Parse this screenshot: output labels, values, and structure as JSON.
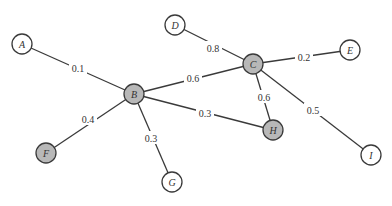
{
  "diagram": {
    "type": "weighted-graph",
    "width": 392,
    "height": 206,
    "colors": {
      "edge": "#3a3a3a",
      "node_stroke": "#3a3a3a",
      "node_fill_default": "#ffffff",
      "node_fill_highlight": "#b8b8b8",
      "text": "#333333"
    },
    "nodes": [
      {
        "id": "A",
        "label": "A",
        "x": 22,
        "y": 44,
        "r": 10,
        "highlighted": false
      },
      {
        "id": "B",
        "label": "B",
        "x": 134,
        "y": 94,
        "r": 10,
        "highlighted": true
      },
      {
        "id": "C",
        "label": "C",
        "x": 253,
        "y": 64,
        "r": 10,
        "highlighted": true
      },
      {
        "id": "D",
        "label": "D",
        "x": 175,
        "y": 25,
        "r": 10,
        "highlighted": false
      },
      {
        "id": "E",
        "label": "E",
        "x": 350,
        "y": 50,
        "r": 10,
        "highlighted": false
      },
      {
        "id": "F",
        "label": "F",
        "x": 46,
        "y": 153,
        "r": 10,
        "highlighted": true
      },
      {
        "id": "G",
        "label": "G",
        "x": 172,
        "y": 182,
        "r": 10,
        "highlighted": false
      },
      {
        "id": "H",
        "label": "H",
        "x": 273,
        "y": 130,
        "r": 10,
        "highlighted": true
      },
      {
        "id": "I",
        "label": "I",
        "x": 371,
        "y": 155,
        "r": 10,
        "highlighted": false
      }
    ],
    "edges": [
      {
        "from": "A",
        "to": "B",
        "weight": "0.1",
        "lx": 78,
        "ly": 68
      },
      {
        "from": "B",
        "to": "C",
        "weight": "0.6",
        "lx": 193,
        "ly": 78
      },
      {
        "from": "B",
        "to": "H",
        "weight": "0.3",
        "lx": 205,
        "ly": 113
      },
      {
        "from": "B",
        "to": "F",
        "weight": "0.4",
        "lx": 88,
        "ly": 119
      },
      {
        "from": "B",
        "to": "G",
        "weight": "0.3",
        "lx": 151,
        "ly": 138
      },
      {
        "from": "D",
        "to": "C",
        "weight": "0.8",
        "lx": 213,
        "ly": 48
      },
      {
        "from": "C",
        "to": "E",
        "weight": "0.2",
        "lx": 304,
        "ly": 57
      },
      {
        "from": "C",
        "to": "H",
        "weight": "0.6",
        "lx": 264,
        "ly": 97
      },
      {
        "from": "C",
        "to": "I",
        "weight": "0.5",
        "lx": 313,
        "ly": 110
      }
    ]
  }
}
